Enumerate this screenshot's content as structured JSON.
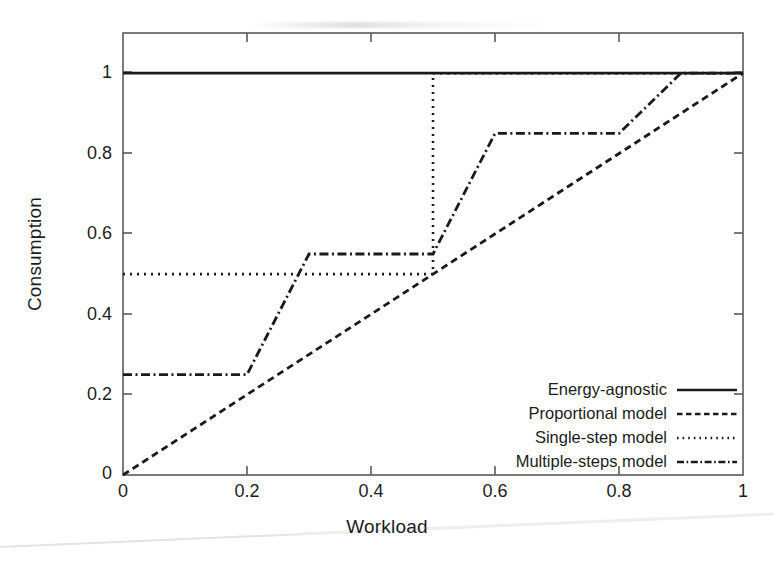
{
  "chart_data": {
    "type": "line",
    "title": "",
    "xlabel": "Workload",
    "ylabel": "Consumption",
    "xlim": [
      0,
      1
    ],
    "ylim": [
      0,
      1.1
    ],
    "grid": false,
    "legend_position": "lower right",
    "xticks": [
      "0",
      "0.2",
      "0.4",
      "0.6",
      "0.8",
      "1"
    ],
    "xtick_values": [
      0,
      0.2,
      0.4,
      0.6,
      0.8,
      1
    ],
    "yticks": [
      "0",
      "0.2",
      "0.4",
      "0.6",
      "0.8",
      "1"
    ],
    "ytick_values": [
      0,
      0.2,
      0.4,
      0.6,
      0.8,
      1
    ],
    "series": [
      {
        "name": "Energy-agnostic",
        "style": "solid",
        "x": [
          0,
          1
        ],
        "y": [
          1,
          1
        ]
      },
      {
        "name": "Proportional model",
        "style": "dashed",
        "x": [
          0,
          1
        ],
        "y": [
          0,
          1
        ]
      },
      {
        "name": "Single-step model",
        "style": "dotted",
        "x": [
          0,
          0.5,
          0.5,
          1
        ],
        "y": [
          0.5,
          0.5,
          1,
          1
        ]
      },
      {
        "name": "Multiple-steps model",
        "style": "dash-dot",
        "x": [
          0,
          0.2,
          0.3,
          0.5,
          0.6,
          0.8,
          0.9,
          1
        ],
        "y": [
          0.25,
          0.25,
          0.55,
          0.55,
          0.85,
          0.85,
          1,
          1
        ]
      }
    ]
  },
  "axes": {
    "x_title": "Workload",
    "y_title": "Consumption"
  },
  "legend": {
    "entries": [
      {
        "label": "Energy-agnostic",
        "style": "solid"
      },
      {
        "label": "Proportional model",
        "style": "dashed"
      },
      {
        "label": "Single-step model",
        "style": "dotted"
      },
      {
        "label": "Multiple-steps model",
        "style": "dash-dot"
      }
    ]
  },
  "colors": {
    "line": "#1a1a1a",
    "axis": "#4a4a4a",
    "background": "#ffffff",
    "text": "#1c1c1c"
  }
}
